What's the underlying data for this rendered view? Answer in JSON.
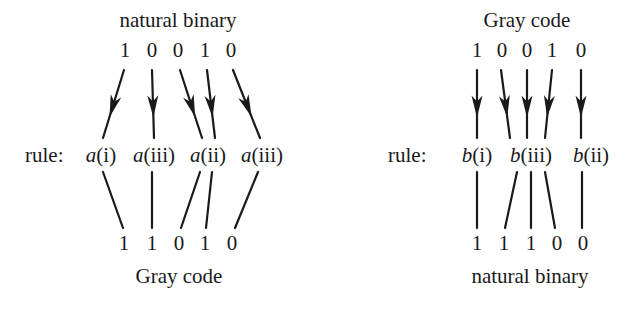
{
  "left": {
    "top_title": "natural binary",
    "top_digits": [
      "1",
      "0",
      "0",
      "1",
      "0"
    ],
    "rule_prefix": "rule:",
    "rules": [
      {
        "fn": "a",
        "arg": "(i)"
      },
      {
        "fn": "a",
        "arg": "(iii)"
      },
      {
        "fn": "a",
        "arg": "(ii)"
      },
      {
        "fn": "a",
        "arg": "(iii)"
      }
    ],
    "bottom_digits": [
      "1",
      "1",
      "0",
      "1",
      "0"
    ],
    "bottom_title": "Gray code"
  },
  "right": {
    "top_title": "Gray code",
    "top_digits": [
      "1",
      "0",
      "0",
      "1",
      "0"
    ],
    "rule_prefix": "rule:",
    "rules": [
      {
        "fn": "b",
        "arg": "(i)"
      },
      {
        "fn": "b",
        "arg": "(iii)"
      },
      {
        "fn": "b",
        "arg": "(ii)"
      }
    ],
    "bottom_digits": [
      "1",
      "1",
      "1",
      "0",
      "0"
    ],
    "bottom_title": "natural binary"
  }
}
